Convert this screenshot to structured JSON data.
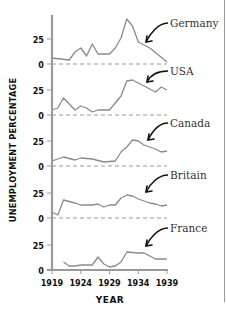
{
  "chart_data": {
    "type": "line",
    "title": "",
    "xlabel": "YEAR",
    "ylabel": "UNEMPLOYMENT PERCENTAGE",
    "x_ticks": [
      1919,
      1924,
      1929,
      1934,
      1939
    ],
    "y_ticks_per_panel": [
      0,
      25
    ],
    "xlim": [
      1919,
      1939
    ],
    "grid": false,
    "legend": "inline arrows labeling each panel",
    "layout": "small multiples, vertically stacked panels sharing x-axis",
    "series": [
      {
        "name": "Germany",
        "x": [
          1919,
          1922,
          1923,
          1924,
          1925,
          1926,
          1927,
          1929,
          1930,
          1931,
          1932,
          1933,
          1934,
          1936,
          1939
        ],
        "values": [
          6,
          4,
          12,
          16,
          8,
          20,
          10,
          10,
          16,
          26,
          45,
          38,
          22,
          16,
          2
        ]
      },
      {
        "name": "USA",
        "x": [
          1919,
          1920,
          1921,
          1923,
          1924,
          1925,
          1926,
          1927,
          1929,
          1931,
          1932,
          1933,
          1934,
          1935,
          1937,
          1938,
          1939
        ],
        "values": [
          5,
          7,
          17,
          5,
          9,
          7,
          3,
          5,
          5,
          19,
          34,
          35,
          32,
          29,
          23,
          28,
          25
        ]
      },
      {
        "name": "Canada",
        "x": [
          1919,
          1921,
          1923,
          1924,
          1926,
          1928,
          1930,
          1931,
          1932,
          1933,
          1934,
          1935,
          1937,
          1938,
          1939
        ],
        "values": [
          5,
          9,
          6,
          8,
          7,
          4,
          5,
          14,
          19,
          26,
          25,
          21,
          17,
          14,
          15
        ]
      },
      {
        "name": "Britain",
        "x": [
          1919,
          1920,
          1921,
          1923,
          1924,
          1926,
          1927,
          1928,
          1929,
          1930,
          1931,
          1932,
          1933,
          1934,
          1936,
          1937,
          1938,
          1939
        ],
        "values": [
          6,
          3,
          18,
          15,
          13,
          13,
          14,
          11,
          13,
          13,
          20,
          23,
          22,
          19,
          15,
          14,
          12,
          13
        ]
      },
      {
        "name": "France",
        "x": [
          1921,
          1922,
          1923,
          1924,
          1926,
          1927,
          1928,
          1929,
          1930,
          1931,
          1932,
          1934,
          1935,
          1936,
          1937,
          1939
        ],
        "values": [
          8,
          4,
          4,
          5,
          5,
          13,
          6,
          3,
          4,
          8,
          18,
          17,
          17,
          14,
          11,
          11
        ]
      }
    ]
  },
  "style": {
    "line_color": "#8a8a8a",
    "axis_color": "#9a9a9a",
    "baseline_dash_color": "#9a9a9a",
    "text_color": "#111111",
    "arrow_color": "#111111"
  }
}
